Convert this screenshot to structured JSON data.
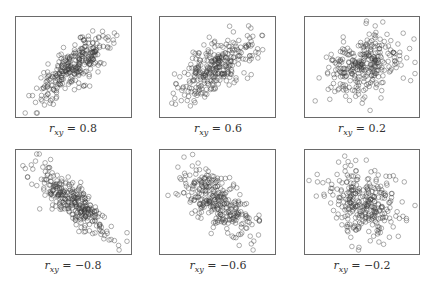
{
  "chart_data": [
    {
      "type": "scatter",
      "title": "",
      "caption_var": "r",
      "caption_sub": "xy",
      "r": 0.8,
      "label": "= 0.8",
      "n": 300,
      "grid": false,
      "xlabel": "",
      "ylabel": ""
    },
    {
      "type": "scatter",
      "title": "",
      "caption_var": "r",
      "caption_sub": "xy",
      "r": 0.6,
      "label": "= 0.6",
      "n": 300,
      "grid": false,
      "xlabel": "",
      "ylabel": ""
    },
    {
      "type": "scatter",
      "title": "",
      "caption_var": "r",
      "caption_sub": "xy",
      "r": 0.2,
      "label": "= 0.2",
      "n": 300,
      "grid": false,
      "xlabel": "",
      "ylabel": ""
    },
    {
      "type": "scatter",
      "title": "",
      "caption_var": "r",
      "caption_sub": "xy",
      "r": -0.8,
      "label": "= −0.8",
      "n": 300,
      "grid": false,
      "xlabel": "",
      "ylabel": ""
    },
    {
      "type": "scatter",
      "title": "",
      "caption_var": "r",
      "caption_sub": "xy",
      "r": -0.6,
      "label": "= −0.6",
      "n": 300,
      "grid": false,
      "xlabel": "",
      "ylabel": ""
    },
    {
      "type": "scatter",
      "title": "",
      "caption_var": "r",
      "caption_sub": "xy",
      "r": -0.2,
      "label": "= −0.2",
      "n": 300,
      "grid": false,
      "xlabel": "",
      "ylabel": ""
    }
  ],
  "style": {
    "marker": "open-circle",
    "marker_color": "#3a3a3a",
    "frame_color": "#6a6a6a"
  }
}
